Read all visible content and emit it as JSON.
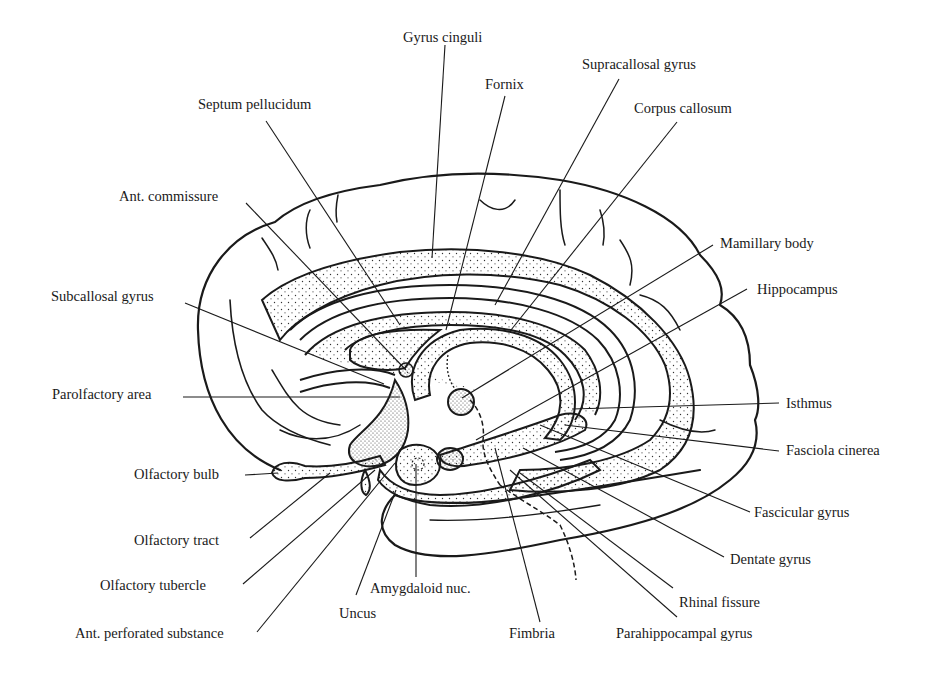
{
  "diagram": {
    "type": "anatomical-labeled-illustration",
    "colors": {
      "ink": "#1a1a1a",
      "background": "#ffffff",
      "stipple": "#333333"
    },
    "labels": [
      {
        "id": "gyrus-cinguli",
        "text": "Gyrus cinguli",
        "x": 403,
        "y": 37,
        "target": [
          432,
          258
        ]
      },
      {
        "id": "fornix",
        "text": "Fornix",
        "x": 485,
        "y": 84,
        "target": [
          446,
          330
        ]
      },
      {
        "id": "supracallosal-gyrus",
        "text": "Supracallosal gyrus",
        "x": 582,
        "y": 57,
        "target": [
          495,
          305
        ]
      },
      {
        "id": "corpus-callosum",
        "text": "Corpus callosum",
        "x": 634,
        "y": 101,
        "target": [
          511,
          330
        ]
      },
      {
        "id": "septum-pellucidum",
        "text": "Septum pellucidum",
        "x": 198,
        "y": 98,
        "target": [
          400,
          325
        ]
      },
      {
        "id": "ant-commissure",
        "text": "Ant. commissure",
        "x": 119,
        "y": 189,
        "target": [
          406,
          370
        ]
      },
      {
        "id": "mamillary-body",
        "text": "Mamillary body",
        "x": 720,
        "y": 236,
        "target": [
          462,
          398
        ]
      },
      {
        "id": "hippocampus",
        "text": "Hippocampus",
        "x": 757,
        "y": 282,
        "target": [
          476,
          440
        ]
      },
      {
        "id": "subcallosal-gyrus",
        "text": "Subcallosal gyrus",
        "x": 51,
        "y": 289,
        "target": [
          384,
          384
        ]
      },
      {
        "id": "parolfactory-area",
        "text": "Parolfactory area",
        "x": 52,
        "y": 387,
        "target": [
          400,
          397
        ]
      },
      {
        "id": "isthmus",
        "text": "Isthmus",
        "x": 786,
        "y": 396,
        "target": [
          572,
          409
        ]
      },
      {
        "id": "fasciola-cinerea",
        "text": "Fasciola cinerea",
        "x": 786,
        "y": 443,
        "target": [
          565,
          425
        ]
      },
      {
        "id": "olfactory-bulb",
        "text": "Olfactory bulb",
        "x": 134,
        "y": 467,
        "target": [
          278,
          473
        ]
      },
      {
        "id": "fascicular-gyrus",
        "text": "Fascicular gyrus",
        "x": 754,
        "y": 505,
        "target": [
          540,
          425
        ]
      },
      {
        "id": "olfactory-tract",
        "text": "Olfactory tract",
        "x": 134,
        "y": 533,
        "target": [
          330,
          473
        ]
      },
      {
        "id": "dentate-gyrus",
        "text": "Dentate gyrus",
        "x": 730,
        "y": 552,
        "target": [
          523,
          448
        ]
      },
      {
        "id": "olfactory-tubercle",
        "text": "Olfactory tubercle",
        "x": 100,
        "y": 578,
        "target": [
          375,
          470
        ]
      },
      {
        "id": "amygdaloid-nuc",
        "text": "Amygdaloid nuc.",
        "x": 370,
        "y": 581,
        "target": [
          416,
          464
        ]
      },
      {
        "id": "uncus",
        "text": "Uncus",
        "x": 339,
        "y": 606,
        "target": [
          396,
          490
        ]
      },
      {
        "id": "rhinal-fissure",
        "text": "Rhinal fissure",
        "x": 679,
        "y": 595,
        "target": [
          520,
          473
        ]
      },
      {
        "id": "ant-perforated-substance",
        "text": "Ant. perforated substance",
        "x": 75,
        "y": 635,
        "target": [
          395,
          463
        ]
      },
      {
        "id": "fimbria",
        "text": "Fimbria",
        "x": 509,
        "y": 634,
        "target": [
          495,
          448
        ]
      },
      {
        "id": "parahippocampal-gyrus",
        "text": "Parahippocampal gyrus",
        "x": 616,
        "y": 634,
        "target": [
          510,
          470
        ]
      }
    ]
  }
}
